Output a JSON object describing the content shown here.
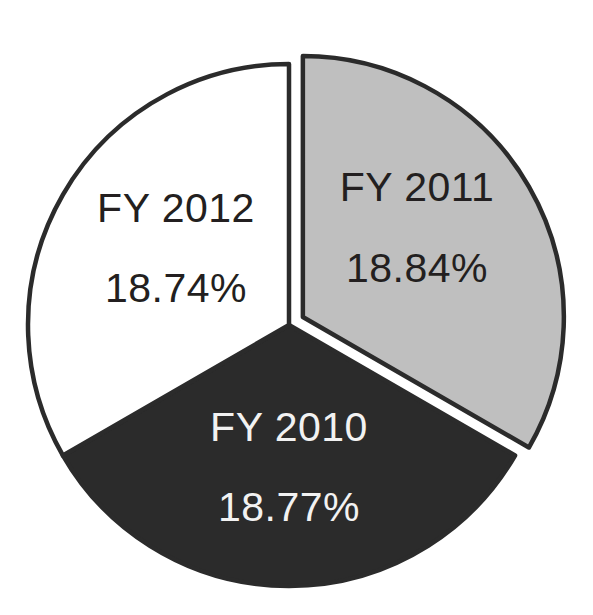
{
  "chart_data": {
    "type": "pie",
    "title": "",
    "subtitle": "",
    "xlabel": "",
    "ylabel": "",
    "legend": "none",
    "grid": false,
    "value_unit": "%",
    "categories": [
      "FY 2011",
      "FY 2010",
      "FY 2012"
    ],
    "values": [
      18.84,
      18.77,
      18.74
    ],
    "labels_inside": true,
    "slices": [
      {
        "name": "FY 2011",
        "value": 18.84,
        "value_label": "18.84%",
        "fill": "#bfbfbf",
        "stroke": "#2b2b2b",
        "text_color": "#231f20",
        "exploded": true,
        "start_angle_deg": 0,
        "end_angle_deg": 120,
        "label_x": 417,
        "label_y": 201,
        "value_x": 417,
        "value_y": 282
      },
      {
        "name": "FY 2010",
        "value": 18.77,
        "value_label": "18.77%",
        "fill": "#2b2b2b",
        "stroke": "#2b2b2b",
        "text_color": "#f2f2f2",
        "exploded": false,
        "start_angle_deg": 120,
        "end_angle_deg": 240,
        "label_x": 289,
        "label_y": 441,
        "value_x": 289,
        "value_y": 521
      },
      {
        "name": "FY 2012",
        "value": 18.74,
        "value_label": "18.74%",
        "fill": "#ffffff",
        "stroke": "#2b2b2b",
        "text_color": "#231f20",
        "exploded": false,
        "start_angle_deg": 240,
        "end_angle_deg": 360,
        "label_x": 176,
        "label_y": 222,
        "value_x": 176,
        "value_y": 302
      }
    ],
    "geometry": {
      "center_x": 289,
      "center_y": 325,
      "radius": 261,
      "explode_offset": 16,
      "stroke_width": 4.5
    },
    "colors": {
      "background": "#ffffff",
      "outline": "#2b2b2b",
      "slice_gray": "#bfbfbf",
      "slice_dark": "#2b2b2b",
      "slice_white": "#ffffff",
      "text_on_light": "#231f20",
      "text_on_dark": "#f2f2f2"
    }
  }
}
